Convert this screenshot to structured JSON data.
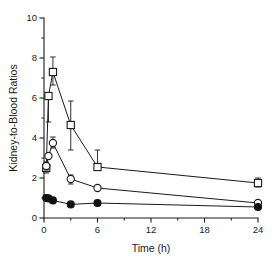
{
  "figure": {
    "background_color": "#ffffff",
    "ink_color": "#1a1a1a"
  },
  "chart_data": {
    "type": "line",
    "title": "",
    "subtitle": "",
    "xlabel": "Time (h)",
    "ylabel": "Kidney-to-Blood Ratios",
    "xlim": [
      0,
      24
    ],
    "ylim": [
      0,
      10
    ],
    "xticks": [
      0,
      6,
      12,
      18,
      24
    ],
    "xticklabels": [
      "0",
      "6",
      "12",
      "18",
      "24"
    ],
    "xminorticks": [
      3,
      9,
      15,
      21
    ],
    "yticks": [
      0,
      2,
      4,
      6,
      8,
      10
    ],
    "yticklabels": [
      "0",
      "2",
      "4",
      "6",
      "8",
      "10"
    ],
    "yminorticks": [
      1,
      3,
      5,
      7,
      9
    ],
    "grid": false,
    "legend": "none",
    "annotations": [],
    "series": [
      {
        "name": "open-square-series",
        "marker": "open-square",
        "x": [
          0.25,
          0.5,
          1.0,
          3.0,
          6.0,
          24.0
        ],
        "values": [
          2.5,
          6.1,
          7.3,
          4.65,
          2.55,
          1.75
        ],
        "err_low": [
          0.25,
          1.3,
          0.65,
          1.25,
          0.1,
          0.2
        ],
        "err_high": [
          0.25,
          0.0,
          0.75,
          1.2,
          0.85,
          0.25
        ]
      },
      {
        "name": "open-circle-series",
        "marker": "open-circle",
        "x": [
          0.25,
          0.5,
          1.0,
          3.0,
          6.0,
          24.0
        ],
        "values": [
          2.6,
          3.1,
          3.75,
          1.95,
          1.5,
          0.75
        ],
        "err_low": [
          0.2,
          0.0,
          0.25,
          0.25,
          0.0,
          0.0
        ],
        "err_high": [
          0.2,
          0.0,
          0.3,
          0.2,
          0.0,
          0.0
        ]
      },
      {
        "name": "filled-circle-series",
        "marker": "filled-circle",
        "x": [
          0.25,
          0.5,
          1.0,
          3.0,
          6.0,
          24.0
        ],
        "values": [
          1.0,
          0.98,
          0.88,
          0.68,
          0.75,
          0.55
        ],
        "err_low": [
          0.0,
          0.0,
          0.0,
          0.0,
          0.0,
          0.0
        ],
        "err_high": [
          0.0,
          0.0,
          0.0,
          0.0,
          0.0,
          0.0
        ]
      }
    ]
  }
}
